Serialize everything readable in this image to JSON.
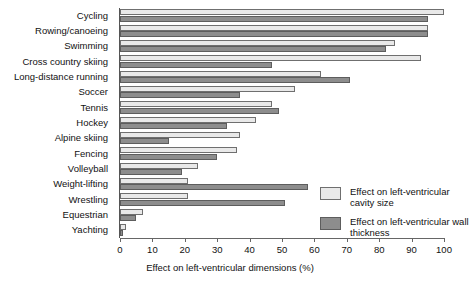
{
  "chart_data": {
    "type": "bar",
    "orientation": "horizontal",
    "title": "",
    "xlabel": "Effect on left-ventricular dimensions (%)",
    "ylabel": "",
    "xlim": [
      0,
      100
    ],
    "xticks": [
      0,
      10,
      20,
      30,
      40,
      50,
      60,
      70,
      80,
      90,
      100
    ],
    "grid": false,
    "legend_position": "right-lower",
    "categories": [
      "Cycling",
      "Rowing/canoeing",
      "Swimming",
      "Cross country skiing",
      "Long-distance running",
      "Soccer",
      "Tennis",
      "Hockey",
      "Alpine skiing",
      "Fencing",
      "Volleyball",
      "Weight-lifting",
      "Wrestling",
      "Equestrian",
      "Yachting"
    ],
    "series": [
      {
        "name": "Effect on left-ventricular cavity size",
        "key": "cavity",
        "color": "#e9e9e9",
        "values": [
          100,
          95,
          85,
          93,
          62,
          54,
          47,
          42,
          37,
          36,
          24,
          21,
          21,
          7,
          2
        ]
      },
      {
        "name": "Effect on left-ventricular wall thickness",
        "key": "wall",
        "color": "#8d8d8d",
        "values": [
          95,
          95,
          82,
          47,
          71,
          37,
          49,
          33,
          15,
          30,
          19,
          58,
          51,
          5,
          1
        ]
      }
    ]
  },
  "legend": {
    "items": [
      {
        "label": "Effect on left-ventricular cavity size",
        "swatch": "light"
      },
      {
        "label": "Effect on left-ventricular wall thickness",
        "swatch": "dark"
      }
    ]
  },
  "axis": {
    "x_title": "Effect on left-ventricular dimensions (%)",
    "tick_labels": [
      "0",
      "10",
      "20",
      "30",
      "40",
      "50",
      "60",
      "70",
      "80",
      "90",
      "100"
    ]
  }
}
